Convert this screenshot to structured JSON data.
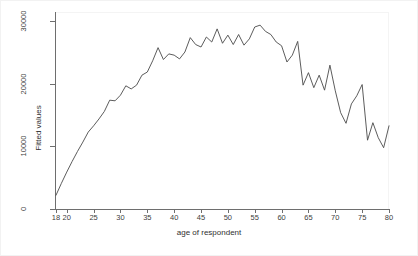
{
  "chart_data": {
    "type": "line",
    "title": "",
    "subtitle": "",
    "xlabel": "age of respondent",
    "ylabel": "Fitted values",
    "xlim": [
      18,
      80
    ],
    "ylim": [
      0,
      31500
    ],
    "grid": false,
    "legend": null,
    "line_color": "#4a4a4a",
    "background": "#ffffff",
    "xticks": [
      18,
      20,
      25,
      30,
      35,
      40,
      45,
      50,
      55,
      60,
      65,
      70,
      75,
      80
    ],
    "xticklabels": [
      "18",
      "20",
      "25",
      "30",
      "35",
      "40",
      "45",
      "50",
      "55",
      "60",
      "65",
      "70",
      "75",
      "80"
    ],
    "yticks": [
      0,
      10000,
      20000,
      30000
    ],
    "yticklabels": [
      "0",
      "10000",
      "20000",
      "30000"
    ],
    "series": [
      {
        "name": "Fitted values",
        "x": [
          18,
          19,
          20,
          21,
          22,
          23,
          24,
          25,
          26,
          27,
          28,
          29,
          30,
          31,
          32,
          33,
          34,
          35,
          36,
          37,
          38,
          39,
          40,
          41,
          42,
          43,
          44,
          45,
          46,
          47,
          48,
          49,
          50,
          51,
          52,
          53,
          54,
          55,
          56,
          57,
          58,
          59,
          60,
          61,
          62,
          63,
          64,
          65,
          66,
          67,
          68,
          69,
          70,
          71,
          72,
          73,
          74,
          75,
          76,
          77,
          78,
          79,
          80
        ],
        "values": [
          2200,
          4100,
          5900,
          7600,
          9200,
          10700,
          12300,
          13300,
          14400,
          15600,
          17400,
          17300,
          18200,
          19700,
          19200,
          19800,
          21400,
          21900,
          23700,
          25800,
          23900,
          24800,
          24600,
          24000,
          25100,
          27400,
          26300,
          25900,
          27500,
          26700,
          28800,
          26500,
          27800,
          26300,
          27900,
          26200,
          27200,
          29100,
          29400,
          28400,
          27900,
          26700,
          26100,
          23500,
          24600,
          26800,
          19800,
          21800,
          19400,
          21400,
          19000,
          23000,
          18900,
          15400,
          13700,
          16800,
          18100,
          19900,
          11000,
          13800,
          11400,
          9800,
          13300
        ]
      }
    ]
  }
}
